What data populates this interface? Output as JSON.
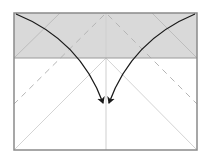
{
  "diagram": {
    "type": "origami-fold-step",
    "colors": {
      "paper_front": "#ffffff",
      "paper_back": "#d9d9d9",
      "outline": "#8a8a8a",
      "crease": "#cfcfcf",
      "valley_fold": "#b5b5b5",
      "arrow": "#1a1a1a"
    },
    "paper": {
      "x": 14,
      "y": 13,
      "width": 183,
      "height": 137
    },
    "folded_band": {
      "y_top": 13,
      "y_bottom": 58
    },
    "arrows": [
      {
        "name": "left-corner-fold-arrow",
        "from": [
          16,
          14
        ],
        "to": [
          103,
          103
        ]
      },
      {
        "name": "right-corner-fold-arrow",
        "from": [
          195,
          14
        ],
        "to": [
          109,
          103
        ]
      }
    ]
  }
}
